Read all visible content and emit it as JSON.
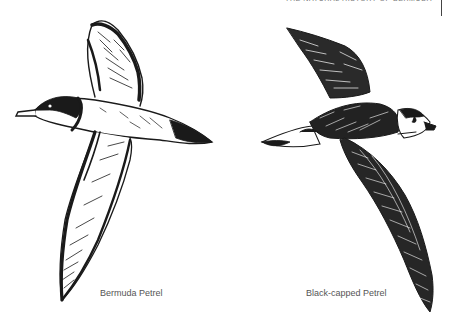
{
  "page": {
    "running_head": "THE NATURAL HISTORY OF BERMUDA"
  },
  "figures": [
    {
      "id": "bermuda-petrel",
      "caption": "Bermuda Petrel",
      "description": "Pen-and-ink sketch of a petrel in flight, head facing left"
    },
    {
      "id": "black-capped-petrel",
      "caption": "Black-capped Petrel",
      "description": "Pen-and-ink sketch of a petrel in flight, head facing right"
    }
  ],
  "colors": {
    "ink": "#1a1a1a",
    "caption": "#555555",
    "background": "#ffffff"
  }
}
